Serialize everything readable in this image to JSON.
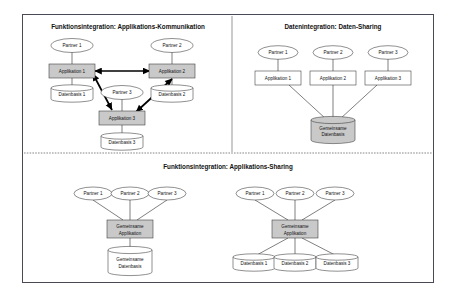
{
  "figure": {
    "title_hidden": "Integrationsformen",
    "panels": [
      {
        "id": "panel-app-kommunikation",
        "title": "Funktionsintegration: Applikations-Kommunikation",
        "partners": [
          "Partner 1",
          "Partner 2",
          "Partner 3"
        ],
        "applications": [
          "Applikation 1",
          "Applikation 2",
          "Applikation 3"
        ],
        "databases": [
          "Datenbasis 1",
          "Datenbasis 2",
          "Datenbasis 3"
        ],
        "app_fill": "#c9c9c9",
        "db_fill": "#ffffff",
        "link_style": "bidirectional-thick"
      },
      {
        "id": "panel-daten-sharing",
        "title": "Datenintegration: Daten-Sharing",
        "partners": [
          "Partner 1",
          "Partner 2",
          "Partner 3"
        ],
        "applications": [
          "Applikation 1",
          "Applikation 2",
          "Applikation 3"
        ],
        "shared_database": [
          "Gemeinsame",
          "Datenbasis"
        ],
        "app_fill": "#ffffff",
        "db_fill": "#c9c9c9",
        "link_style": "converging"
      },
      {
        "id": "panel-app-sharing",
        "title": "Funktionsintegration: Applikations-Sharing",
        "variants": [
          {
            "id": "variant-shared-db",
            "partners": [
              "Partner 1",
              "Partner 2",
              "Partner 3"
            ],
            "shared_application": [
              "Gemeinsame",
              "Applikation"
            ],
            "shared_database": [
              "Gemeinsame",
              "Datenbasis"
            ],
            "app_fill": "#c9c9c9",
            "db_fill": "#ffffff"
          },
          {
            "id": "variant-separate-db",
            "partners": [
              "Partner 1",
              "Partner 2",
              "Partner 3"
            ],
            "shared_application": [
              "Gemeinsame",
              "Applikation"
            ],
            "databases": [
              "Datenbasis 1",
              "Datenbasis 2",
              "Datenbasis 3"
            ],
            "app_fill": "#c9c9c9",
            "db_fill": "#ffffff"
          }
        ]
      }
    ],
    "colors": {
      "frame_border": "#4a4a55",
      "shape_stroke": "#333333",
      "gray_fill": "#c9c9c9",
      "white_fill": "#ffffff",
      "text": "#111111"
    }
  }
}
